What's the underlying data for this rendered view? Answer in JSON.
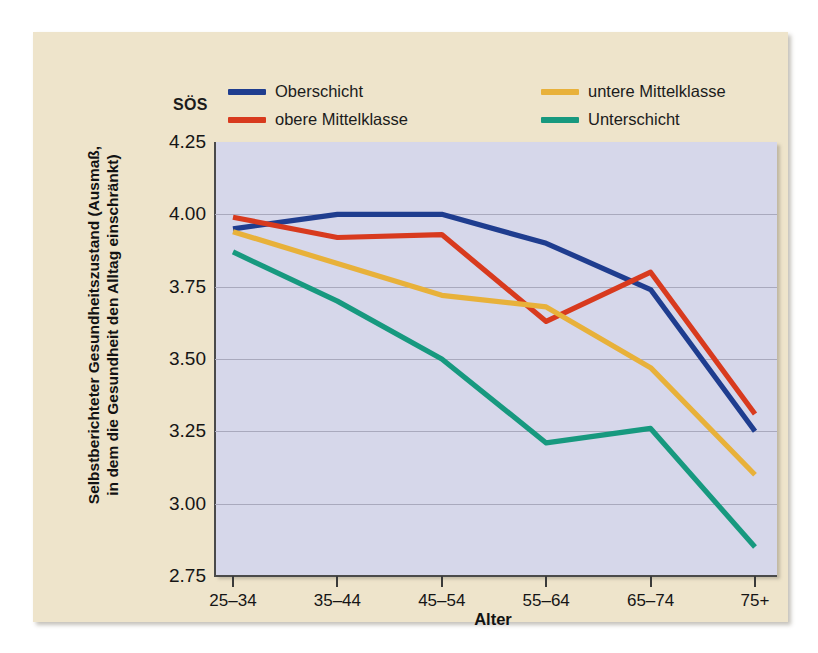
{
  "figure": {
    "background_color": "#eee4cb",
    "plot_background_color": "#d6d7ea",
    "gridline_color": "#a9a9bd"
  },
  "legend": {
    "title": "SÖS",
    "position": "top",
    "entries": [
      {
        "label": "Oberschicht",
        "color": "#1f3d8f"
      },
      {
        "label": "obere Mittelklasse",
        "color": "#d83a1e"
      },
      {
        "label": "untere Mittelklasse",
        "color": "#e8b13a"
      },
      {
        "label": "Unterschicht",
        "color": "#17997f"
      }
    ]
  },
  "chart_data": {
    "type": "line",
    "title": "",
    "xlabel": "Alter",
    "ylabel": "Selbstberichteter Gesundheitszustand (Ausmaß, in dem die Gesundheit den Alltag einschränkt)",
    "ylabel_line1": "Selbstberichteter Gesundheitszustand (Ausmaß,",
    "ylabel_line2": "in dem die Gesundheit den Alltag einschränkt)",
    "categories": [
      "25–34",
      "35–44",
      "45–54",
      "55–64",
      "65–74",
      "75+"
    ],
    "ylim": [
      2.75,
      4.25
    ],
    "yticks": [
      "4.25",
      "4.00",
      "3.75",
      "3.50",
      "3.25",
      "3.00",
      "2.75"
    ],
    "ytick_values": [
      4.25,
      4.0,
      3.75,
      3.5,
      3.25,
      3.0,
      2.75
    ],
    "grid": "horizontal",
    "legend_position": "top",
    "series": [
      {
        "name": "Oberschicht",
        "color": "#1f3d8f",
        "values": [
          3.95,
          4.0,
          4.0,
          3.9,
          3.74,
          3.25
        ]
      },
      {
        "name": "obere Mittelklasse",
        "color": "#d83a1e",
        "values": [
          3.99,
          3.92,
          3.93,
          3.63,
          3.8,
          3.31
        ]
      },
      {
        "name": "untere Mittelklasse",
        "color": "#e8b13a",
        "values": [
          3.94,
          3.83,
          3.72,
          3.68,
          3.47,
          3.1
        ]
      },
      {
        "name": "Unterschicht",
        "color": "#17997f",
        "values": [
          3.87,
          3.7,
          3.5,
          3.21,
          3.26,
          2.85
        ]
      }
    ]
  }
}
